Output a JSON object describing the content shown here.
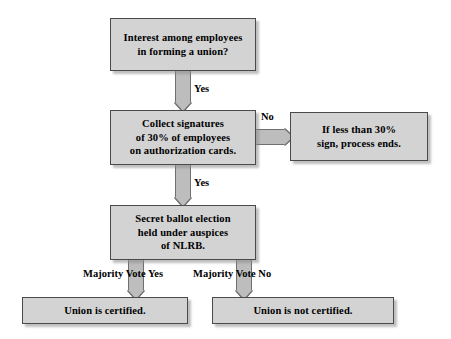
{
  "diagram": {
    "colors": {
      "node_fill": "#d3d3d3",
      "node_border": "#4a4a4a",
      "arrow_fill": "#bdbdbd",
      "arrow_border": "#6f6f6f",
      "text": "#000000",
      "background": "#ffffff"
    },
    "nodes": {
      "interest": "Interest among employees\nin forming a union?",
      "collect": "Collect signatures\nof 30% of employees\non authorization cards.",
      "less_than_30": "If less than 30%\nsign, process ends.",
      "ballot": "Secret ballot election\nheld under auspices\nof NLRB.",
      "certified": "Union is certified.",
      "not_certified": "Union is not certified."
    },
    "edges": {
      "yes_1": "Yes",
      "yes_2": "Yes",
      "no_1": "No",
      "majority_yes": "Majority Vote Yes",
      "majority_no": "Majority Vote No"
    }
  }
}
